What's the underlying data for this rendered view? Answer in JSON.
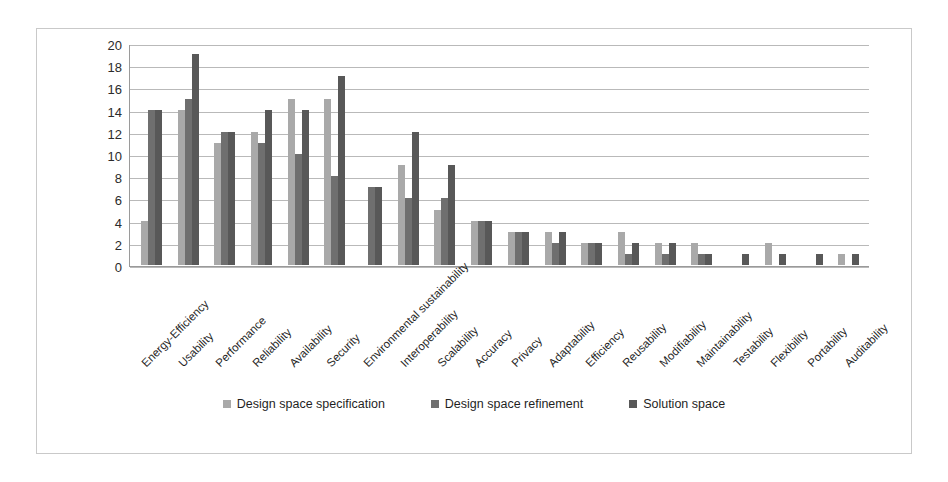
{
  "chart_data": {
    "type": "bar",
    "title": "",
    "xlabel": "",
    "ylabel": "",
    "ylim": [
      0,
      20
    ],
    "ytick_step": 2,
    "yticks": [
      20,
      18,
      16,
      14,
      12,
      10,
      8,
      6,
      4,
      2,
      0
    ],
    "grid": true,
    "legend_position": "bottom-center",
    "categories": [
      "Energy-Efficiency",
      "Usability",
      "Performance",
      "Reliability",
      "Availability",
      "Security",
      "Environmental sustainability",
      "Interoperability",
      "Scalability",
      "Accuracy",
      "Privacy",
      "Adaptability",
      "Efficiency",
      "Reusability",
      "Modifiability",
      "Maintainability",
      "Testability",
      "Flexibility",
      "Portability",
      "Auditability"
    ],
    "series": [
      {
        "name": "Design space specification",
        "color": "#a9a9a9",
        "values": [
          4,
          14,
          11,
          12,
          15,
          15,
          0,
          9,
          5,
          4,
          3,
          3,
          2,
          3,
          2,
          2,
          0,
          2,
          0,
          1
        ]
      },
      {
        "name": "Design space refinement",
        "color": "#6f6f6f",
        "values": [
          14,
          15,
          12,
          11,
          10,
          8,
          7,
          6,
          6,
          4,
          3,
          2,
          2,
          1,
          1,
          1,
          0,
          0,
          0,
          0
        ]
      },
      {
        "name": "Solution space",
        "color": "#585858",
        "values": [
          14,
          19,
          12,
          14,
          14,
          17,
          7,
          12,
          9,
          4,
          3,
          3,
          2,
          2,
          2,
          1,
          1,
          1,
          1,
          1
        ]
      }
    ]
  },
  "legend": {
    "items": [
      {
        "label": "Design space specification",
        "color": "#a9a9a9"
      },
      {
        "label": "Design space refinement",
        "color": "#6f6f6f"
      },
      {
        "label": "Solution space",
        "color": "#585858"
      }
    ]
  }
}
